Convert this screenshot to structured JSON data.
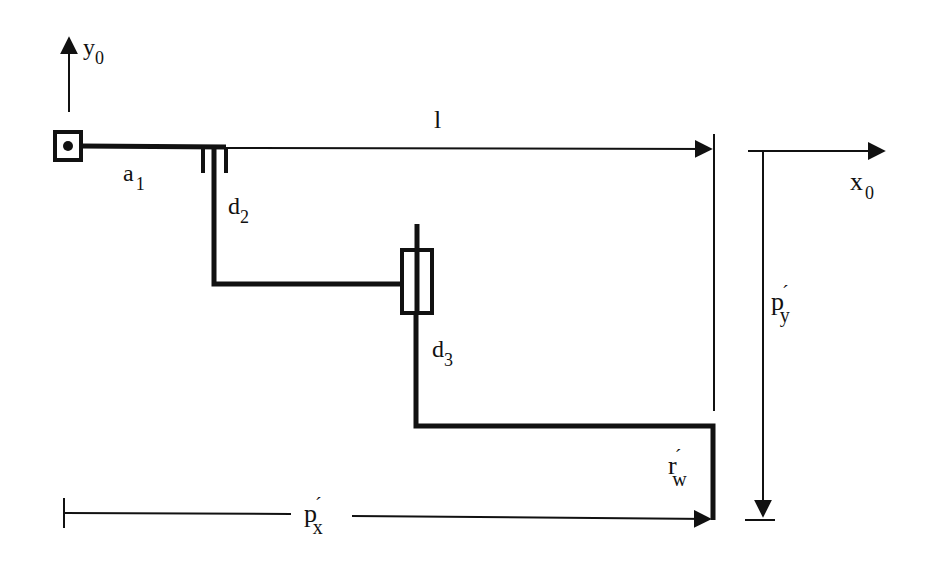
{
  "diagram": {
    "type": "robot-arm-kinematic-schematic",
    "colors": {
      "ink": "#111111",
      "background": "#ffffff"
    },
    "axes": {
      "y0": {
        "base": "y",
        "sub": "0"
      },
      "x0": {
        "base": "x",
        "sub": "0"
      }
    },
    "links": {
      "a1": {
        "base": "a",
        "sub": "1"
      },
      "d2": {
        "base": "d",
        "sub": "2"
      },
      "d3": {
        "base": "d",
        "sub": "3"
      }
    },
    "dimensions": {
      "l": {
        "base": "l"
      },
      "px": {
        "base": "p",
        "prime": "´",
        "sub": "x"
      },
      "py": {
        "base": "p",
        "prime": "´",
        "sub": "y"
      },
      "rw": {
        "base": "r",
        "prime": "´",
        "sub": "w"
      }
    },
    "joints": [
      {
        "name": "base-revolute-joint",
        "kind": "revolute"
      },
      {
        "name": "prismatic-joint-d2",
        "kind": "prismatic"
      },
      {
        "name": "prismatic-joint-d3",
        "kind": "prismatic"
      }
    ]
  }
}
